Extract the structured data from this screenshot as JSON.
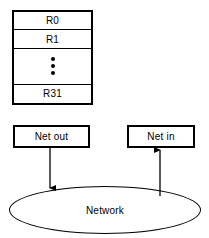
{
  "diagram": {
    "colors": {
      "stroke": "#000000",
      "background": "#ffffff",
      "text": "#000000"
    },
    "register_file": {
      "name": "register-file",
      "rows": [
        {
          "label": "R0",
          "kind": "register"
        },
        {
          "label": "R1",
          "kind": "register"
        },
        {
          "label": "",
          "kind": "ellipsis",
          "dots": 3
        },
        {
          "label": "R31",
          "kind": "register"
        }
      ]
    },
    "net_boxes": [
      {
        "id": "net-out",
        "label": "Net out"
      },
      {
        "id": "net-in",
        "label": "Net in"
      }
    ],
    "network": {
      "label": "Network",
      "shape": "ellipse"
    },
    "connectors": [
      {
        "id": "net-out-to-network",
        "from": "Net out",
        "to": "Network",
        "direction": "down",
        "arrowhead": "end"
      },
      {
        "id": "network-to-net-in",
        "from": "Network",
        "to": "Net in",
        "direction": "up",
        "arrowhead": "end"
      }
    ]
  }
}
